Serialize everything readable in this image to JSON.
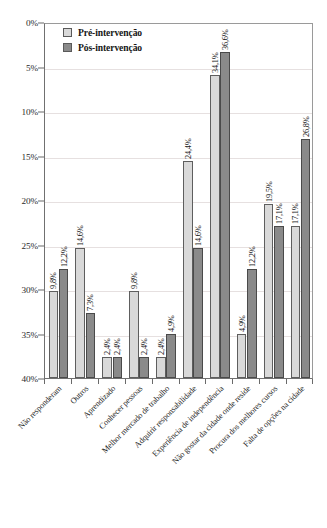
{
  "chart_data": {
    "type": "bar",
    "title": "",
    "xlabel": "",
    "ylabel": "",
    "ylim": [
      0,
      40
    ],
    "y_axis_inverted": true,
    "grid": true,
    "legend_position": "top-left",
    "y_ticks": [
      "0%",
      "5%",
      "10%",
      "15%",
      "20%",
      "25%",
      "30%",
      "35%",
      "40%"
    ],
    "y_tick_values": [
      0,
      5,
      10,
      15,
      20,
      25,
      30,
      35,
      40
    ],
    "categories": [
      "Não responderam",
      "Outros",
      "Aprendizado",
      "Conhecer pessoas",
      "Melhor mercado de trabalho",
      "Adquirir responsabilidade",
      "Experiência de independência",
      "Não gostar da cidade onde reside",
      "Procura dos melhores cursos",
      "Falta de opções na cidade"
    ],
    "series": [
      {
        "name": "Pré-intervenção",
        "color": "#d9d9d9",
        "values": [
          9.8,
          14.6,
          2.4,
          9.8,
          2.4,
          24.4,
          34.1,
          4.9,
          19.5,
          17.1
        ],
        "labels": [
          "9,8%",
          "14,6%",
          "2,4%",
          "9,8%",
          "2,4%",
          "24,4%",
          "34,1%",
          "4,9%",
          "19,5%",
          "17,1%"
        ]
      },
      {
        "name": "Pós-intervenção",
        "color": "#8a8a8a",
        "values": [
          12.2,
          7.3,
          2.4,
          2.4,
          4.9,
          14.6,
          36.6,
          12.2,
          17.1,
          26.8
        ],
        "labels": [
          "12,2%",
          "7,3%",
          "2,4%",
          "2,4%",
          "4,9%",
          "14,6%",
          "36,6%",
          "12,2%",
          "17,1%",
          "26,8%"
        ]
      }
    ]
  },
  "legend": {
    "entries": [
      {
        "label": "Pré-intervenção",
        "swatch": "pre"
      },
      {
        "label": "Pós-intervenção",
        "swatch": "pos"
      }
    ]
  }
}
